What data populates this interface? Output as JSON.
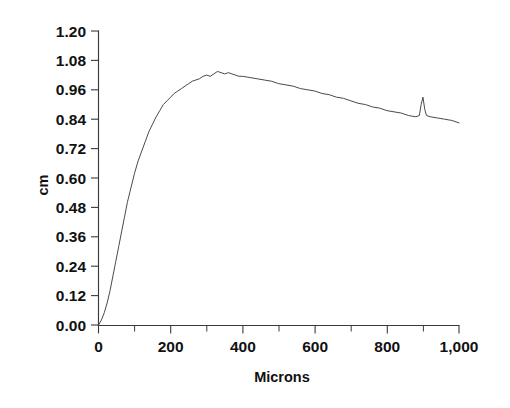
{
  "chart_data": {
    "type": "line",
    "title": "",
    "xlabel": "Microns",
    "ylabel": "cm",
    "xlim": [
      0,
      1000
    ],
    "ylim": [
      0.0,
      1.2
    ],
    "grid": false,
    "legend": "none",
    "x_ticks": [
      0,
      200,
      400,
      600,
      800,
      1000
    ],
    "x_tick_labels": [
      "0",
      "200",
      "400",
      "600",
      "800",
      "1,000"
    ],
    "x_minor_tick_step": 100,
    "y_ticks": [
      0.0,
      0.12,
      0.24,
      0.36,
      0.48,
      0.6,
      0.72,
      0.84,
      0.96,
      1.08,
      1.2
    ],
    "y_tick_labels": [
      "0.00",
      "0.12",
      "0.24",
      "0.36",
      "0.48",
      "0.60",
      "0.72",
      "0.84",
      "0.96",
      "1.08",
      "1.20"
    ],
    "line_color": "#4a4a4a",
    "series": [
      {
        "name": "profile",
        "x": [
          0,
          8,
          16,
          24,
          32,
          40,
          48,
          56,
          64,
          72,
          80,
          90,
          100,
          110,
          120,
          130,
          140,
          150,
          160,
          170,
          180,
          190,
          200,
          210,
          220,
          230,
          240,
          250,
          260,
          270,
          280,
          290,
          300,
          310,
          320,
          330,
          340,
          350,
          360,
          370,
          380,
          390,
          400,
          420,
          440,
          460,
          480,
          500,
          520,
          540,
          560,
          580,
          600,
          620,
          640,
          660,
          680,
          700,
          720,
          740,
          760,
          780,
          800,
          820,
          840,
          860,
          880,
          890,
          895,
          900,
          905,
          910,
          920,
          940,
          960,
          980,
          1000
        ],
        "y": [
          0.0,
          0.02,
          0.05,
          0.09,
          0.14,
          0.2,
          0.26,
          0.32,
          0.38,
          0.44,
          0.5,
          0.56,
          0.62,
          0.67,
          0.71,
          0.75,
          0.79,
          0.82,
          0.85,
          0.875,
          0.9,
          0.915,
          0.93,
          0.945,
          0.955,
          0.965,
          0.975,
          0.985,
          0.995,
          1.0,
          1.005,
          1.015,
          1.02,
          1.015,
          1.025,
          1.035,
          1.03,
          1.025,
          1.03,
          1.025,
          1.02,
          1.015,
          1.015,
          1.01,
          1.005,
          1.0,
          0.995,
          0.985,
          0.98,
          0.975,
          0.965,
          0.96,
          0.955,
          0.945,
          0.94,
          0.93,
          0.925,
          0.915,
          0.905,
          0.9,
          0.89,
          0.885,
          0.875,
          0.87,
          0.865,
          0.855,
          0.85,
          0.855,
          0.9,
          0.93,
          0.88,
          0.855,
          0.85,
          0.845,
          0.84,
          0.835,
          0.825
        ]
      }
    ],
    "notes": {
      "peak_value": 1.035,
      "peak_x": 330,
      "end_value": 0.825,
      "spike_x": 900,
      "spike_value": 0.93
    }
  },
  "axes": {
    "y_axis_title": "cm",
    "x_axis_title": "Microns"
  }
}
